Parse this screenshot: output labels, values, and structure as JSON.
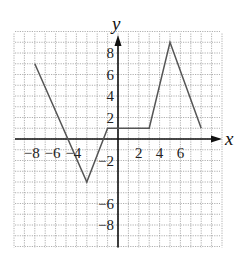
{
  "chart_data": {
    "type": "line",
    "title": "",
    "xlabel": "x",
    "ylabel": "y",
    "xlim": [
      -10,
      10
    ],
    "ylim": [
      -10,
      10
    ],
    "grid": true,
    "grid_step": 1,
    "x_tick_labels": [
      "-8",
      "-6",
      "-4",
      "2",
      "4",
      "6"
    ],
    "x_tick_values": [
      -8,
      -6,
      -4,
      2,
      4,
      6
    ],
    "y_tick_labels": [
      "8",
      "6",
      "4",
      "2",
      "-2",
      "-6",
      "-8"
    ],
    "y_tick_values": [
      8,
      6,
      4,
      2,
      -2,
      -6,
      -8
    ],
    "series": [
      {
        "name": "piecewise linear function",
        "x": [
          -8,
          -3,
          -1,
          3,
          5,
          8
        ],
        "y": [
          7,
          -4,
          1,
          1,
          9,
          1
        ]
      }
    ],
    "colors": {
      "curve": "#555555",
      "axes": "#111111",
      "grid": "#9a9a9a"
    }
  },
  "labels": {
    "x_axis": "x",
    "y_axis": "y"
  }
}
